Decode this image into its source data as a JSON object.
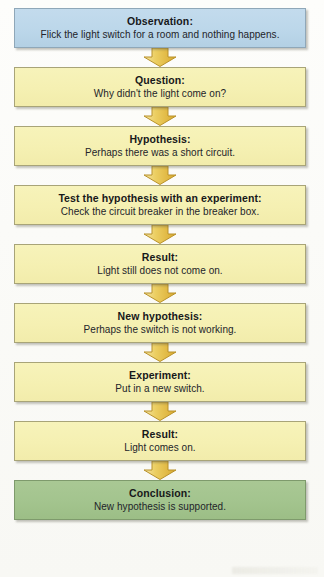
{
  "diagram": {
    "colors": {
      "observation_fill": "#bcd7ea",
      "step_fill": "#f5f0b2",
      "conclusion_fill": "#a3c48e",
      "arrow_fill": "#e8c24a",
      "arrow_stroke": "#b8912a",
      "text": "#17181a",
      "background": "#fdfdfb"
    },
    "arrow_icon": "arrow-down-icon",
    "steps": [
      {
        "id": "observation",
        "title": "Observation:",
        "body": "Flick the light switch for a room and nothing happens.",
        "color": "blue"
      },
      {
        "id": "question",
        "title": "Question:",
        "body": "Why didn't the light come on?",
        "color": "yellow"
      },
      {
        "id": "hypothesis",
        "title": "Hypothesis:",
        "body": "Perhaps there was a short circuit.",
        "color": "yellow"
      },
      {
        "id": "test-hypothesis",
        "title": "Test the hypothesis with an experiment:",
        "body": "Check the circuit breaker in the breaker box.",
        "color": "yellow"
      },
      {
        "id": "result-1",
        "title": "Result:",
        "body": "Light still does not come on.",
        "color": "yellow"
      },
      {
        "id": "new-hypothesis",
        "title": "New hypothesis:",
        "body": "Perhaps the switch is not working.",
        "color": "yellow"
      },
      {
        "id": "experiment",
        "title": "Experiment:",
        "body": "Put in a new switch.",
        "color": "yellow"
      },
      {
        "id": "result-2",
        "title": "Result:",
        "body": "Light comes on.",
        "color": "yellow"
      },
      {
        "id": "conclusion",
        "title": "Conclusion:",
        "body": "New hypothesis is supported.",
        "color": "green"
      }
    ]
  }
}
